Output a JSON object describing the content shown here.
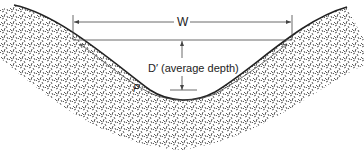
{
  "diagram": {
    "labels": {
      "width": "W",
      "depth": "D′ (average depth)",
      "perimeter": "P"
    },
    "colors": {
      "line": "#222222",
      "texture": "#333333",
      "background": "#ffffff"
    }
  }
}
